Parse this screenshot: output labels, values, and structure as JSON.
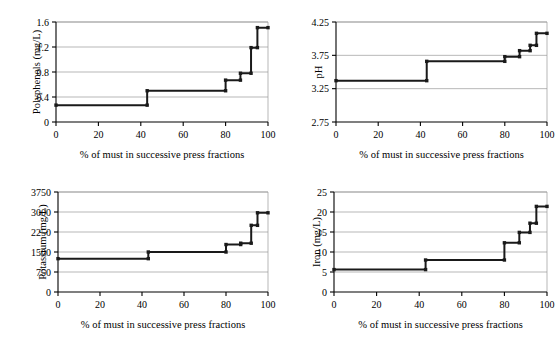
{
  "figure": {
    "shared_xlabel": "% of must in successive press fractions",
    "line_color": "#1a1a1a",
    "grid_color": "#9a9a9a",
    "axis_color": "#000000",
    "background": "#ffffff"
  },
  "chart_data": [
    {
      "id": "polyphenols",
      "type": "line",
      "title": "",
      "xlabel": "% of must in successive press fractions",
      "ylabel": "Polyphenols  (mg/L)",
      "xlim": [
        0,
        100
      ],
      "ylim": [
        0,
        1.6
      ],
      "xticks": [
        0,
        20,
        40,
        60,
        80,
        100
      ],
      "yticks": [
        0,
        0.4,
        0.8,
        1.2,
        1.6
      ],
      "ytick_labels": [
        "0",
        "0.4",
        "0.8",
        "1.2",
        "1.6"
      ],
      "grid": true,
      "legend": "none",
      "step_style": "post",
      "x": [
        0,
        43,
        43,
        80,
        80,
        87,
        87,
        92,
        92,
        95,
        95,
        100
      ],
      "y": [
        0.27,
        0.27,
        0.5,
        0.5,
        0.67,
        0.67,
        0.78,
        0.78,
        1.19,
        1.19,
        1.51,
        1.51
      ],
      "markers": [
        {
          "x": 0,
          "y": 0.27
        },
        {
          "x": 43,
          "y": 0.27
        },
        {
          "x": 43,
          "y": 0.5
        },
        {
          "x": 80,
          "y": 0.5
        },
        {
          "x": 80,
          "y": 0.67
        },
        {
          "x": 87,
          "y": 0.67
        },
        {
          "x": 87,
          "y": 0.78
        },
        {
          "x": 92,
          "y": 0.78
        },
        {
          "x": 92,
          "y": 1.19
        },
        {
          "x": 95,
          "y": 1.19
        },
        {
          "x": 95,
          "y": 1.51
        },
        {
          "x": 100,
          "y": 1.51
        }
      ]
    },
    {
      "id": "ph",
      "type": "line",
      "title": "",
      "xlabel": "% of must in successive press fractions",
      "ylabel": "pH",
      "xlim": [
        0,
        100
      ],
      "ylim": [
        2.75,
        4.25
      ],
      "xticks": [
        0,
        20,
        40,
        60,
        80,
        100
      ],
      "yticks": [
        2.75,
        3.25,
        3.75,
        4.25
      ],
      "ytick_labels": [
        "2.75",
        "3.25",
        "3.75",
        "4.25"
      ],
      "grid": true,
      "legend": "none",
      "step_style": "post",
      "x": [
        0,
        43,
        43,
        80,
        80,
        87,
        87,
        92,
        92,
        95,
        95,
        100
      ],
      "y": [
        3.37,
        3.37,
        3.66,
        3.66,
        3.73,
        3.73,
        3.82,
        3.82,
        3.9,
        3.9,
        4.08,
        4.08
      ],
      "markers": [
        {
          "x": 0,
          "y": 3.37
        },
        {
          "x": 43,
          "y": 3.37
        },
        {
          "x": 43,
          "y": 3.66
        },
        {
          "x": 80,
          "y": 3.66
        },
        {
          "x": 80,
          "y": 3.73
        },
        {
          "x": 87,
          "y": 3.73
        },
        {
          "x": 87,
          "y": 3.82
        },
        {
          "x": 92,
          "y": 3.82
        },
        {
          "x": 92,
          "y": 3.9
        },
        {
          "x": 95,
          "y": 3.9
        },
        {
          "x": 95,
          "y": 4.08
        },
        {
          "x": 100,
          "y": 4.08
        }
      ]
    },
    {
      "id": "potassium",
      "type": "line",
      "title": "",
      "xlabel": "% of must in successive press fractions",
      "ylabel": "Potassium (mg/L)",
      "xlim": [
        0,
        100
      ],
      "ylim": [
        0,
        3750
      ],
      "xticks": [
        0,
        20,
        40,
        60,
        80,
        100
      ],
      "yticks": [
        0,
        750,
        1500,
        2250,
        3000,
        3750
      ],
      "ytick_labels": [
        "0",
        "750",
        "1500",
        "2250",
        "3000",
        "3750"
      ],
      "grid": true,
      "legend": "none",
      "step_style": "post",
      "x": [
        0,
        43,
        43,
        80,
        80,
        87,
        87,
        92,
        92,
        95,
        95,
        100
      ],
      "y": [
        1250,
        1250,
        1500,
        1500,
        1780,
        1780,
        1830,
        1830,
        2500,
        2500,
        2970,
        2970
      ],
      "markers": [
        {
          "x": 0,
          "y": 1250
        },
        {
          "x": 43,
          "y": 1250
        },
        {
          "x": 43,
          "y": 1500
        },
        {
          "x": 80,
          "y": 1500
        },
        {
          "x": 80,
          "y": 1780
        },
        {
          "x": 87,
          "y": 1780
        },
        {
          "x": 87,
          "y": 1830
        },
        {
          "x": 92,
          "y": 1830
        },
        {
          "x": 92,
          "y": 2500
        },
        {
          "x": 95,
          "y": 2500
        },
        {
          "x": 95,
          "y": 2970
        },
        {
          "x": 100,
          "y": 2970
        }
      ]
    },
    {
      "id": "iron",
      "type": "line",
      "title": "",
      "xlabel": "% of must in successive press fractions",
      "ylabel": "Iron (mg/L)",
      "xlim": [
        0,
        100
      ],
      "ylim": [
        0,
        25
      ],
      "xticks": [
        0,
        20,
        40,
        60,
        80,
        100
      ],
      "yticks": [
        0,
        5,
        10,
        15,
        20,
        25
      ],
      "ytick_labels": [
        "0",
        "5",
        "10",
        "15",
        "20",
        "25"
      ],
      "grid": true,
      "legend": "none",
      "step_style": "post",
      "x": [
        0,
        43,
        43,
        80,
        80,
        87,
        87,
        92,
        92,
        95,
        95,
        100
      ],
      "y": [
        5.6,
        5.6,
        8.0,
        8.0,
        12.3,
        12.3,
        14.9,
        14.9,
        17.2,
        17.2,
        21.4,
        21.4
      ],
      "markers": [
        {
          "x": 0,
          "y": 5.6
        },
        {
          "x": 43,
          "y": 5.6
        },
        {
          "x": 43,
          "y": 8.0
        },
        {
          "x": 80,
          "y": 8.0
        },
        {
          "x": 80,
          "y": 12.3
        },
        {
          "x": 87,
          "y": 12.3
        },
        {
          "x": 87,
          "y": 14.9
        },
        {
          "x": 92,
          "y": 14.9
        },
        {
          "x": 92,
          "y": 17.2
        },
        {
          "x": 95,
          "y": 17.2
        },
        {
          "x": 95,
          "y": 21.4
        },
        {
          "x": 100,
          "y": 21.4
        }
      ]
    }
  ]
}
